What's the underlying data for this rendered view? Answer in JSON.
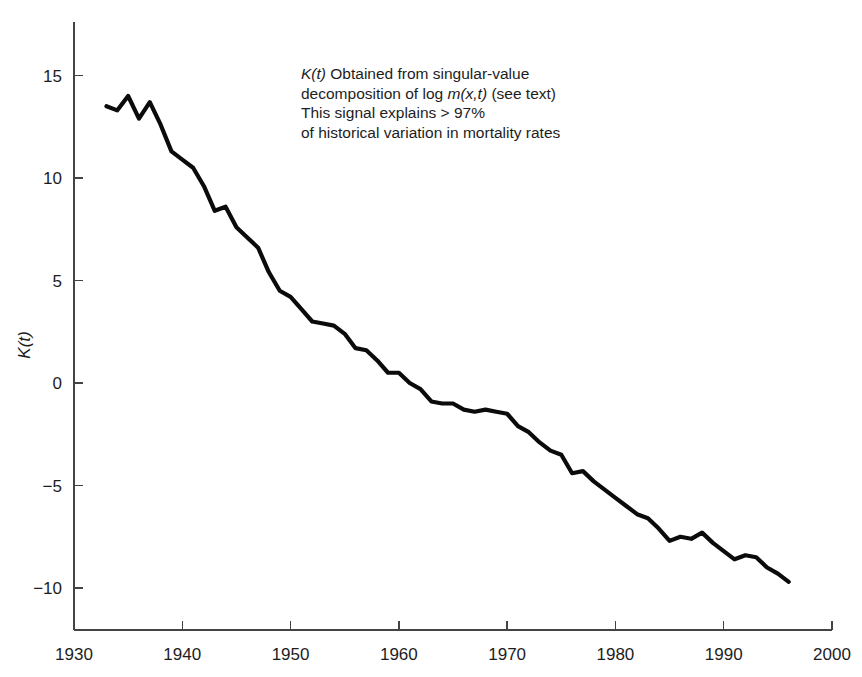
{
  "chart_data": {
    "type": "line",
    "title": "",
    "xlabel": "",
    "ylabel": "K(t)",
    "xlim": [
      1930,
      2000
    ],
    "ylim": [
      -11.5,
      17.5
    ],
    "grid": false,
    "legend": "none",
    "x_ticks": [
      "1930",
      "1940",
      "1950",
      "1960",
      "1970",
      "1980",
      "1990",
      "2000"
    ],
    "y_ticks": [
      "15",
      "10",
      "5",
      "0",
      "-5",
      "-10"
    ],
    "x_tick_values": [
      1930,
      1940,
      1950,
      1960,
      1970,
      1980,
      1990,
      2000
    ],
    "y_tick_values": [
      15,
      10,
      5,
      0,
      -5,
      -10
    ],
    "series": [
      {
        "name": "K(t)",
        "color": "#0b0b0b",
        "x": [
          1933,
          1934,
          1935,
          1936,
          1937,
          1938,
          1939,
          1940,
          1941,
          1942,
          1943,
          1944,
          1945,
          1946,
          1947,
          1948,
          1949,
          1950,
          1951,
          1952,
          1953,
          1954,
          1955,
          1956,
          1957,
          1958,
          1959,
          1960,
          1961,
          1962,
          1963,
          1964,
          1965,
          1966,
          1967,
          1968,
          1969,
          1970,
          1971,
          1972,
          1973,
          1974,
          1975,
          1976,
          1977,
          1978,
          1979,
          1980,
          1981,
          1982,
          1983,
          1984,
          1985,
          1986,
          1987,
          1988,
          1989,
          1990,
          1991,
          1992,
          1993,
          1994,
          1995,
          1996
        ],
        "y": [
          13.5,
          13.3,
          14.0,
          12.9,
          13.7,
          12.6,
          11.3,
          10.9,
          10.5,
          9.6,
          8.4,
          8.6,
          7.6,
          7.1,
          6.6,
          5.4,
          4.5,
          4.2,
          3.6,
          3.0,
          2.9,
          2.8,
          2.4,
          1.7,
          1.6,
          1.1,
          0.5,
          0.5,
          0.0,
          -0.3,
          -0.9,
          -1.0,
          -1.0,
          -1.3,
          -1.4,
          -1.3,
          -1.4,
          -1.5,
          -2.1,
          -2.4,
          -2.9,
          -3.3,
          -3.5,
          -4.4,
          -4.3,
          -4.8,
          -5.2,
          -5.6,
          -6.0,
          -6.4,
          -6.6,
          -7.1,
          -7.7,
          -7.5,
          -7.6,
          -7.3,
          -7.8,
          -8.2,
          -8.6,
          -8.4,
          -8.5,
          -9.0,
          -9.3,
          -9.7
        ]
      }
    ],
    "annotation": {
      "line1_italic_k": "K(t)",
      "line1_rest": " Obtained from singular-value",
      "line2_pre": "decomposition of log ",
      "line2_italic_m": "m(x,t)",
      "line2_post": " (see text)",
      "line3": "This signal explains > 97%",
      "line4": "of historical variation in mortality rates"
    }
  }
}
